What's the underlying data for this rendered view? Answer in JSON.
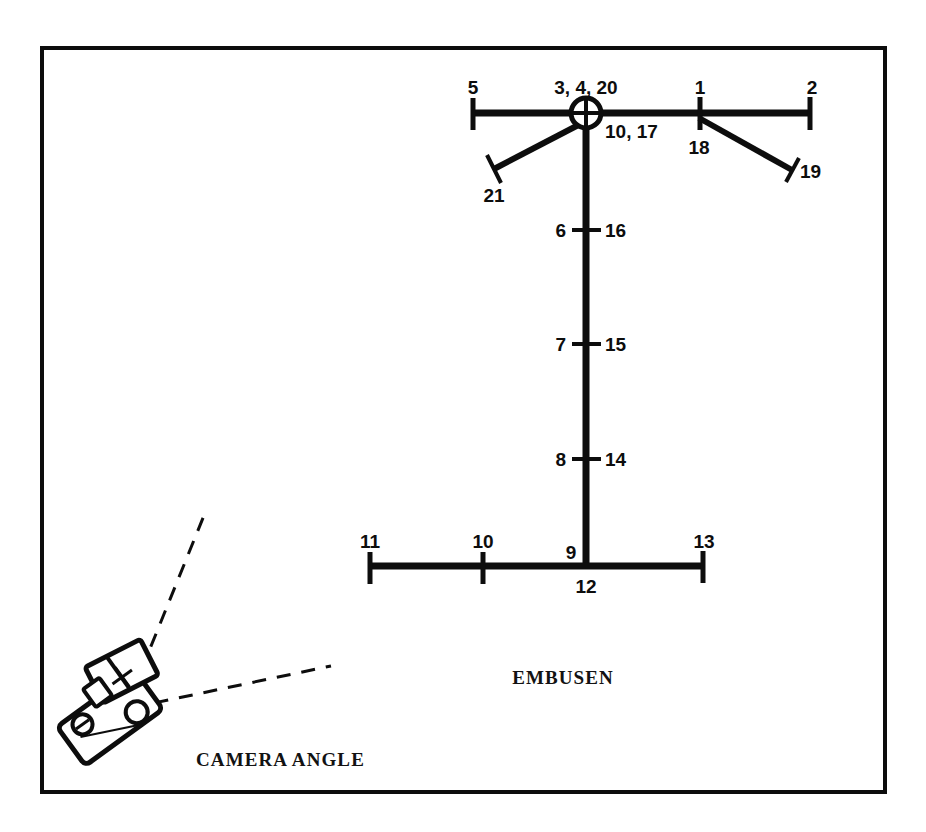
{
  "figure": {
    "title_embusen": "EMBUSEN",
    "title_camera_angle": "CAMERA  ANGLE",
    "frame": {
      "x": 42,
      "y": 48,
      "width": 843,
      "height": 744,
      "stroke": "#0d0d0d",
      "stroke_width": 4
    },
    "colors": {
      "ink": "#0d0d0d",
      "background": "#ffffff"
    }
  },
  "diagram": {
    "name": "embusen-floor-pattern",
    "center_node": {
      "label_above": "3, 4, 20",
      "label_right": "10, 17",
      "cx": 586,
      "cy": 113,
      "r": 16,
      "crosshair": true
    },
    "top_bar": {
      "x1": 472,
      "x2": 812,
      "y": 113,
      "left_label": "5",
      "right_label": "2",
      "mid_right_label": "1",
      "mid_right_sub_label": "18",
      "mid_right_x": 700
    },
    "vertical_bar": {
      "x": 586,
      "y1": 113,
      "y2": 564
    },
    "vertical_ticks": [
      {
        "left_label": "6",
        "right_label": "16",
        "y": 230
      },
      {
        "left_label": "7",
        "right_label": "15",
        "y": 344
      },
      {
        "left_label": "8",
        "right_label": "14",
        "y": 459
      }
    ],
    "bottom_bar": {
      "x1": 368,
      "x2": 705,
      "y": 566,
      "left_label": "11",
      "right_label": "13",
      "tick_label": "10",
      "tick_x": 483,
      "junction_label_above": "9",
      "junction_label_below": "12",
      "junction_x": 586
    },
    "branches": [
      {
        "name": "branch-21",
        "label": "21",
        "from_x": 586,
        "from_y": 119,
        "to_x": 494,
        "to_y": 168
      },
      {
        "name": "branch-19",
        "label": "19",
        "from_x": 700,
        "from_y": 118,
        "to_x": 792,
        "to_y": 170
      }
    ]
  },
  "camera": {
    "name": "camera-illustration",
    "sight_lines": [
      {
        "name": "sight-line-upper",
        "x1": 134,
        "y1": 692,
        "x2": 204,
        "y2": 514
      },
      {
        "name": "sight-line-lower",
        "x1": 134,
        "y1": 707,
        "x2": 330,
        "y2": 667
      }
    ],
    "body_angle_deg": -35,
    "parts": [
      "camera-body",
      "lens-barrel",
      "viewfinder-circle",
      "knob-circle",
      "film-advance"
    ]
  }
}
